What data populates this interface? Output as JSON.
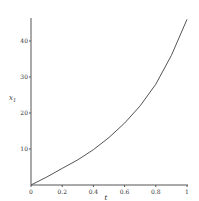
{
  "chart_data": {
    "type": "line",
    "title": "",
    "xlabel": "t",
    "ylabel": "x1",
    "xlim": [
      0,
      1
    ],
    "ylim": [
      0,
      46
    ],
    "grid": false,
    "x_ticks": [
      "0",
      "0.2",
      "0.4",
      "0.6",
      "0.8",
      "1"
    ],
    "y_ticks": [
      "10",
      "20",
      "30",
      "40"
    ],
    "series": [
      {
        "name": "x1(t)",
        "color": "#555555",
        "x": [
          0,
          0.1,
          0.2,
          0.3,
          0.4,
          0.5,
          0.6,
          0.7,
          0.8,
          0.9,
          1.0
        ],
        "values": [
          0,
          2.2,
          4.6,
          7.0,
          9.8,
          13.2,
          17.2,
          22.0,
          28.0,
          36.0,
          46.0
        ]
      }
    ]
  }
}
